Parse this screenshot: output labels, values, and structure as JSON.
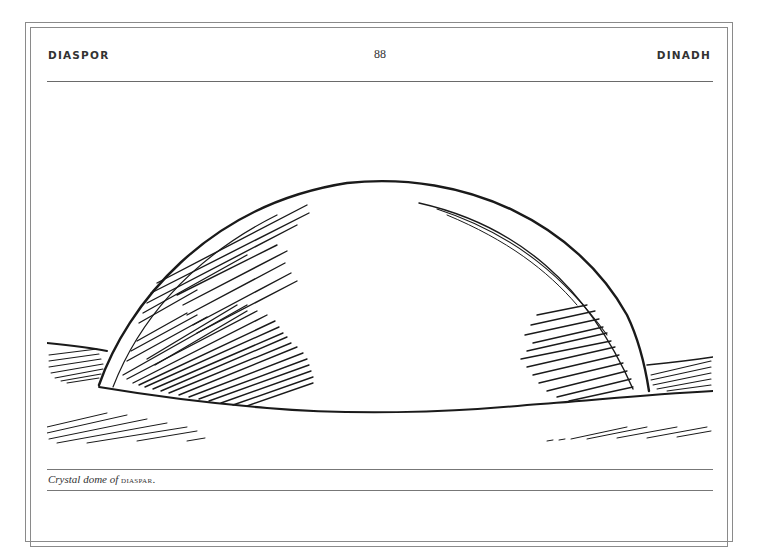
{
  "page": {
    "running_head_left": "DIASPOR",
    "page_number": "88",
    "running_head_right": "DINADH"
  },
  "figure": {
    "caption_italic": "Crystal dome of ",
    "caption_smallcaps": "DIASPAR",
    "caption_end": "."
  }
}
